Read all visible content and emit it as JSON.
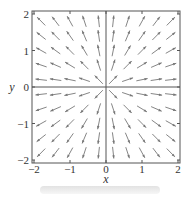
{
  "chart_data": {
    "type": "vector_field",
    "title": "",
    "xlabel": "x",
    "ylabel": "y",
    "xlim": [
      -2.1,
      2.1
    ],
    "ylim": [
      -2.1,
      2.1
    ],
    "xticks": [
      -2,
      -1,
      0,
      1,
      2
    ],
    "yticks": [
      -2,
      -1,
      0,
      1,
      2
    ],
    "xtick_labels": [
      "−2",
      "−1",
      "0",
      "1",
      "2"
    ],
    "ytick_labels": [
      "−2",
      "−1",
      "0",
      "1",
      "2"
    ],
    "field": "radial outward (direction of (x, y)), normalized arrow length",
    "grid_points": [
      -1.8,
      -1.4,
      -1.0,
      -0.6,
      -0.2,
      0.2,
      0.6,
      1.0,
      1.4,
      1.8
    ],
    "arrow_length": 0.32,
    "grid": false,
    "colors": {
      "arrow": "#777777",
      "axis": "#555555",
      "frame": "#555555"
    }
  }
}
